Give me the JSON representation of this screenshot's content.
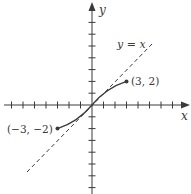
{
  "figure": {
    "type": "function-graph",
    "axes": {
      "x_label": "x",
      "y_label": "y",
      "x_ticks": [
        -7,
        -6,
        -5,
        -4,
        -3,
        -2,
        -1,
        1,
        2,
        3,
        4,
        5,
        6,
        7
      ],
      "y_ticks": [
        -7,
        -6,
        -5,
        -4,
        -3,
        -2,
        -1,
        1,
        2,
        3,
        4,
        5,
        6,
        7
      ]
    },
    "reference_line": {
      "label": "y = x",
      "style": "dashed"
    },
    "curve": {
      "style": "solid",
      "endpoints": [
        {
          "label": "(3, 2)",
          "x": 3,
          "y": 2
        },
        {
          "label": "(−3, −2)",
          "x": -3,
          "y": -2
        }
      ]
    },
    "colors": {
      "ink": "#3a3a3a",
      "background": "#ffffff"
    }
  }
}
